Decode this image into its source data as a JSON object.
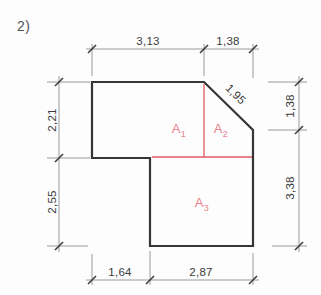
{
  "page": {
    "title": "2)"
  },
  "colors": {
    "outline": "#363636",
    "dimension": "#9a9a9a",
    "tick": "#3d3d3d",
    "accent_red": "#e25862",
    "area_label": "#e8828c",
    "text": "#3a3a3a"
  },
  "dimensions": {
    "top": [
      "3,13",
      "1,38"
    ],
    "left": [
      "2,21",
      "2,55"
    ],
    "right": [
      "1,38",
      "3,38"
    ],
    "bottom": [
      "1,64",
      "2,87"
    ],
    "diagonal": "1,95"
  },
  "areas": [
    {
      "symbol": "A",
      "subscript": "1"
    },
    {
      "symbol": "A",
      "subscript": "2"
    },
    {
      "symbol": "A",
      "subscript": "3"
    }
  ]
}
